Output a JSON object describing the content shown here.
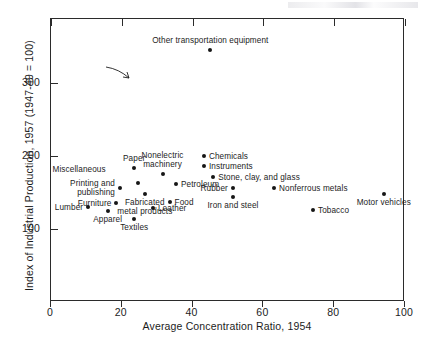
{
  "figure": {
    "plot_bg": "#ffffff",
    "ink": "#1c1c1c",
    "marker_color": "#161616"
  },
  "chart_data": {
    "type": "scatter",
    "title": "",
    "xlabel": "Average Concentration Ratio, 1954",
    "ylabel": "Index of Industrial Production, 1957 (1947-49 = 100)",
    "xlim": [
      0,
      100
    ],
    "ylim": [
      0,
      387
    ],
    "xticks": [
      0,
      20,
      40,
      60,
      80,
      100
    ],
    "xticklabels": [
      "0",
      "20",
      "40",
      "60",
      "80",
      "100"
    ],
    "yticks": [
      100,
      200,
      300
    ],
    "yticklabels": [
      "100",
      "200",
      "300"
    ],
    "grid": false,
    "legend": false,
    "points": [
      {
        "label": "Other transportation equipment",
        "x": 45,
        "y": 345,
        "label_pos": "above"
      },
      {
        "label": "Chemicals",
        "x": 43.2,
        "y": 200,
        "label_pos": "right"
      },
      {
        "label": "Instruments",
        "x": 43.2,
        "y": 186,
        "label_pos": "right"
      },
      {
        "label": "Stone, clay, and glass",
        "x": 45.8,
        "y": 171,
        "label_pos": "right"
      },
      {
        "label": "Rubber",
        "x": 51.4,
        "y": 156,
        "label_pos": "left"
      },
      {
        "label": "Iron and steel",
        "x": 51.4,
        "y": 144,
        "label_pos": "below"
      },
      {
        "label": "Nonferrous metals",
        "x": 63,
        "y": 156,
        "label_pos": "right"
      },
      {
        "label": "Tobacco",
        "x": 74,
        "y": 126,
        "label_pos": "right"
      },
      {
        "label": "Motor vehicles",
        "x": 94,
        "y": 148,
        "label_pos": "below"
      },
      {
        "label": "Paper",
        "x": 23.5,
        "y": 183,
        "label_pos": "above"
      },
      {
        "label": "Nonelectric\nmachinery",
        "x": 31.5,
        "y": 175,
        "label_pos": "above"
      },
      {
        "label": "Petroleum",
        "x": 35.3,
        "y": 162,
        "label_pos": "right"
      },
      {
        "label": "Miscellaneous",
        "x": 24.5,
        "y": 163,
        "label_pos": "arrow"
      },
      {
        "label": "Printing and\npublishing",
        "x": 19.5,
        "y": 156,
        "label_pos": "left"
      },
      {
        "label": "Fabricated\nmetal products",
        "x": 26.5,
        "y": 148,
        "label_pos": "below"
      },
      {
        "label": "Food",
        "x": 33.5,
        "y": 137,
        "label_pos": "right"
      },
      {
        "label": "Furniture",
        "x": 18.5,
        "y": 136,
        "label_pos": "left"
      },
      {
        "label": "Lumber",
        "x": 10.5,
        "y": 130,
        "label_pos": "left"
      },
      {
        "label": "Apparel",
        "x": 16,
        "y": 124,
        "label_pos": "below"
      },
      {
        "label": "Leather",
        "x": 28.8,
        "y": 128,
        "label_pos": "right"
      },
      {
        "label": "Textiles",
        "x": 23.5,
        "y": 113,
        "label_pos": "below"
      }
    ]
  }
}
